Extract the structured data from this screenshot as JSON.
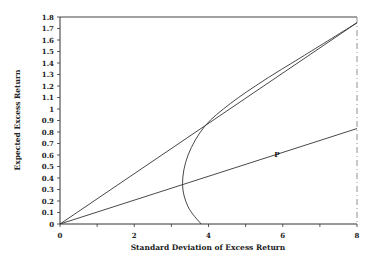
{
  "chart_data": {
    "type": "line",
    "title": "",
    "xlabel": "Standard Deviation of Excess Return",
    "ylabel": "Expected Excess Return",
    "xlim": [
      0,
      8
    ],
    "ylim": [
      0,
      1.8
    ],
    "xticks": [
      0,
      2,
      4,
      6,
      8
    ],
    "xtick_labels": [
      "0",
      "2",
      "4",
      "6",
      "8"
    ],
    "yticks": [
      0,
      0.1,
      0.2,
      0.3,
      0.4,
      0.5,
      0.6,
      0.7,
      0.8,
      0.9,
      1,
      1.1,
      1.2,
      1.3,
      1.4,
      1.5,
      1.6,
      1.7,
      1.8
    ],
    "ytick_labels": [
      "0",
      "0.1",
      "0.2",
      "0.3",
      "0.4",
      "0.5",
      "0.6",
      "0.7",
      "0.8",
      "0.9",
      "1",
      "1.1",
      "1.2",
      "1.3",
      "1.4",
      "1.5",
      "1.6",
      "1.7",
      "1.8"
    ],
    "grid": false,
    "legend": null,
    "series": [
      {
        "name": "Capital market line (tangent)",
        "type": "line",
        "points": [
          [
            0,
            0
          ],
          [
            8,
            1.75
          ]
        ]
      },
      {
        "name": "Line through P",
        "type": "line",
        "points": [
          [
            0,
            0
          ],
          [
            8,
            0.83
          ]
        ]
      },
      {
        "name": "Efficient frontier (hyperbola)",
        "type": "curve",
        "vertex": [
          3.3,
          0.35
        ],
        "points": [
          [
            3.8,
            0
          ],
          [
            3.45,
            0.15
          ],
          [
            3.3,
            0.35
          ],
          [
            3.45,
            0.6
          ],
          [
            3.9,
            0.85
          ],
          [
            4.6,
            1.05
          ],
          [
            5.5,
            1.25
          ],
          [
            6.5,
            1.45
          ],
          [
            8,
            1.75
          ]
        ]
      }
    ],
    "annotations": [
      {
        "text": "P",
        "x": 5.8,
        "y": 0.6
      }
    ]
  }
}
